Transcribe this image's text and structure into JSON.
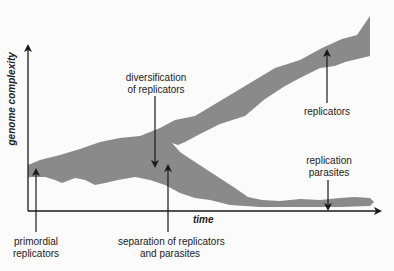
{
  "diagram": {
    "axes": {
      "y_label": "genome complexity",
      "x_label": "time"
    },
    "annotations": {
      "primordial": {
        "line1": "primordial",
        "line2": "replicators"
      },
      "diversification": {
        "line1": "diversification",
        "line2": "of replicators"
      },
      "separation": {
        "line1": "separation of replicators",
        "line2": "and parasites"
      },
      "replicators": {
        "line1": "replicators"
      },
      "parasites": {
        "line1": "replication",
        "line2": "parasites"
      }
    },
    "colors": {
      "band": "#8a8a8a",
      "axis": "#1a1a1a",
      "background": "#fbfbfb"
    }
  }
}
